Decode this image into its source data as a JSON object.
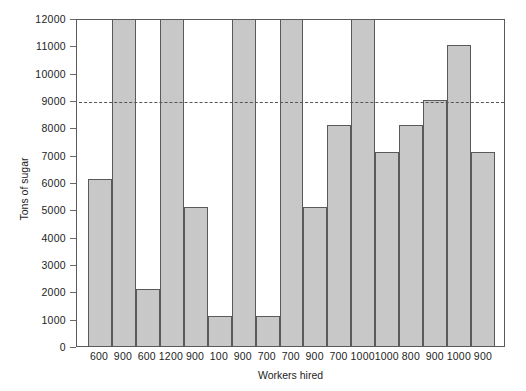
{
  "chart_data": {
    "type": "bar",
    "title": "",
    "xlabel": "Workers hired",
    "ylabel": "Tons of sugar",
    "categories": [
      "600",
      "900",
      "600",
      "1200",
      "900",
      "100",
      "900",
      "700",
      "700",
      "900",
      "700",
      "1000",
      "1000",
      "800",
      "900",
      "1000",
      "900"
    ],
    "values": [
      6100,
      12000,
      2100,
      12000,
      5100,
      1100,
      12000,
      1100,
      12000,
      5100,
      8100,
      12000,
      7100,
      8100,
      9000,
      11000,
      7100
    ],
    "ylim": [
      0,
      12000
    ],
    "ytick_labels": [
      "0",
      "1000",
      "2000",
      "3000",
      "4000",
      "5000",
      "6000",
      "7000",
      "8000",
      "9000",
      "10000",
      "11000",
      "12000"
    ],
    "ytick_values": [
      0,
      1000,
      2000,
      3000,
      4000,
      5000,
      6000,
      7000,
      8000,
      9000,
      10000,
      11000,
      12000
    ],
    "grid": false,
    "legend": "none",
    "annotations": [
      {
        "name": "reference-line",
        "kind": "horizontal-dashed-line",
        "value": 9000,
        "color": "#555555"
      }
    ],
    "style": {
      "bar_fill": "#c8c8c8",
      "bar_stroke": "#5a5a5a",
      "frame_color": "#5a5a5a",
      "text_color": "#1d1d1d",
      "background": "#ffffff"
    }
  }
}
